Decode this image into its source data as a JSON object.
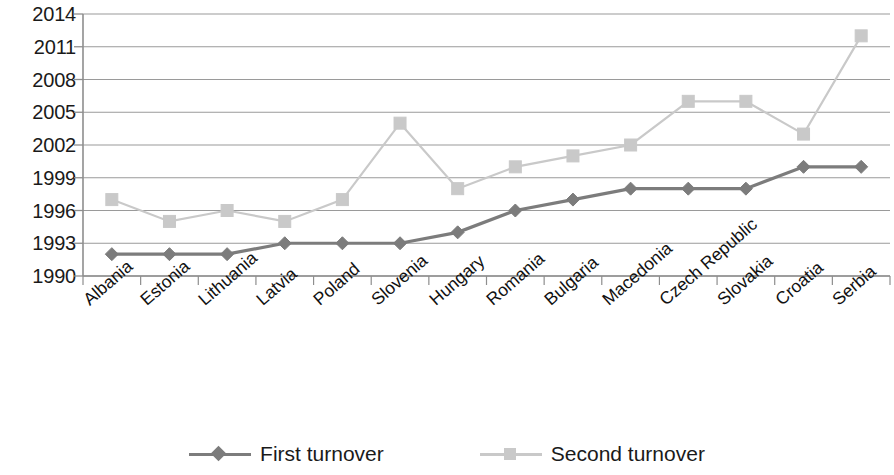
{
  "chart_data": {
    "type": "line",
    "title": "",
    "subtitle": "",
    "xlabel": "",
    "ylabel": "",
    "grid": true,
    "legend_position": "bottom",
    "ylim": [
      1990,
      2014
    ],
    "yticks": [
      1990,
      1993,
      1996,
      1999,
      2002,
      2005,
      2008,
      2011,
      2014
    ],
    "categories": [
      "Albania",
      "Estonia",
      "Lithuania",
      "Latvia",
      "Poland",
      "Slovenia",
      "Hungary",
      "Romania",
      "Bulgaria",
      "Macedonia",
      "Czech Republic",
      "Slovakia",
      "Croatia",
      "Serbia"
    ],
    "series": [
      {
        "name": "First turnover",
        "color": "#7c7c7c",
        "marker": "diamond",
        "values": [
          1992,
          1992,
          1992,
          1993,
          1993,
          1993,
          1994,
          1996,
          1997,
          1998,
          1998,
          1998,
          2000,
          2000
        ]
      },
      {
        "name": "Second turnover",
        "color": "#c9c9c9",
        "marker": "square",
        "values": [
          1997,
          1995,
          1996,
          1995,
          1997,
          2004,
          1998,
          2000,
          2001,
          2002,
          2006,
          2006,
          2003,
          2012
        ]
      }
    ]
  },
  "legend": {
    "items": [
      {
        "label": "First turnover",
        "color": "#7c7c7c",
        "marker": "diamond"
      },
      {
        "label": "Second turnover",
        "color": "#c9c9c9",
        "marker": "square"
      }
    ]
  },
  "axis": {
    "y_tick_labels": [
      "2014",
      "2011",
      "2008",
      "2005",
      "2002",
      "1999",
      "1996",
      "1993",
      "1990"
    ],
    "x_tick_labels": [
      "Albania",
      "Estonia",
      "Lithuania",
      "Latvia",
      "Poland",
      "Slovenia",
      "Hungary",
      "Romania",
      "Bulgaria",
      "Macedonia",
      "Czech Republic",
      "Slovakia",
      "Croatia",
      "Serbia"
    ]
  },
  "style": {
    "axis_color": "#8e8e8e",
    "grid_color": "#9a9a9a",
    "background": "#ffffff"
  }
}
